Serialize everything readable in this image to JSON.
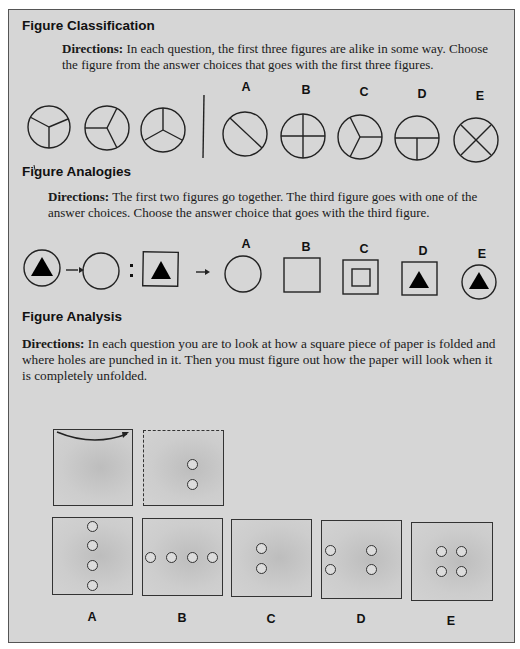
{
  "sections": [
    {
      "title": "Figure Classification",
      "directions_label": "Directions:",
      "directions_text": "In each question, the first three figures are alike in some way. Choose the figure from the answer choices that goes with the first three figures.",
      "choices": [
        "A",
        "B",
        "C",
        "D",
        "E"
      ],
      "stimulus_icons": [
        "circle-three-sectors-y",
        "circle-three-sectors-rotated",
        "circle-three-sectors-inverted-y"
      ],
      "choice_icons": [
        "circle-one-diagonal",
        "circle-cross",
        "circle-three-sectors",
        "circle-inverted-t",
        "circle-x"
      ]
    },
    {
      "title": "Figure Analogies",
      "directions_label": "Directions:",
      "directions_text": "The first two figures go together. The third figure goes with one of the answer choices. Choose the answer choice that goes with the third figure.",
      "choices": [
        "A",
        "B",
        "C",
        "D",
        "E"
      ],
      "stimulus_icons": [
        "circle-with-triangle",
        "arrow",
        "empty-circle",
        "colon",
        "square-with-triangle",
        "arrow"
      ],
      "choice_icons": [
        "empty-circle",
        "empty-square",
        "square-in-square",
        "square-with-triangle",
        "circle-with-triangle"
      ]
    },
    {
      "title": "Figure Analysis",
      "directions_label": "Directions:",
      "directions_text": "In each question you are to look at how a square piece of paper is folded and where holes are punched in it. Then you must figure out how the paper will look when it is completely unfolded.",
      "choices": [
        "A",
        "B",
        "C",
        "D",
        "E"
      ],
      "stimulus": [
        "paper-fold-arrow",
        "folded-paper-two-holes"
      ],
      "choice_holes": [
        "4 holes vertical column",
        "4 holes horizontal row",
        "2 holes left",
        "4 holes at corners spread",
        "4 holes clustered center"
      ]
    }
  ]
}
